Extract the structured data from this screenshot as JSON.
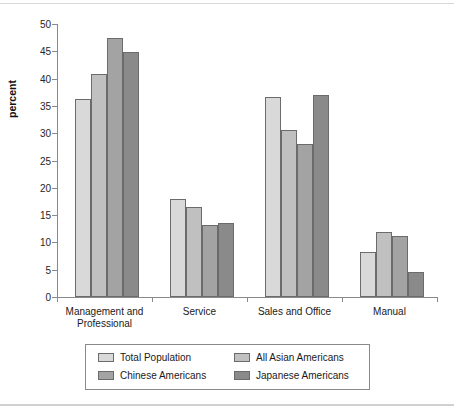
{
  "axis": {
    "ylabel": "percent",
    "yticks": [
      "0",
      "5",
      "10",
      "15",
      "20",
      "25",
      "30",
      "35",
      "40",
      "45",
      "50"
    ]
  },
  "legend": {
    "items": [
      {
        "label": "Total Population",
        "color": "#d9d9d9"
      },
      {
        "label": "All Asian Americans",
        "color": "#c0c0c0"
      },
      {
        "label": "Chinese Americans",
        "color": "#a3a3a3"
      },
      {
        "label": "Japanese Americans",
        "color": "#8a8a8a"
      }
    ]
  },
  "chart_data": {
    "type": "bar",
    "title": "",
    "subtitle": "",
    "xlabel": "",
    "ylabel": "percent",
    "ylim": [
      0,
      50
    ],
    "ytick_step": 5,
    "grid": false,
    "legend_position": "bottom",
    "categories": [
      "Management and\nProfessional",
      "Service",
      "Sales and Office",
      "Manual"
    ],
    "series": [
      {
        "name": "Total Population",
        "color": "#d9d9d9",
        "values": [
          36.3,
          18.0,
          36.7,
          8.3
        ]
      },
      {
        "name": "All Asian Americans",
        "color": "#c0c0c0",
        "values": [
          40.9,
          16.4,
          30.5,
          11.9
        ]
      },
      {
        "name": "Chinese Americans",
        "color": "#a3a3a3",
        "values": [
          47.5,
          13.2,
          28.0,
          11.2
        ]
      },
      {
        "name": "Japanese Americans",
        "color": "#8a8a8a",
        "values": [
          44.8,
          13.6,
          37.0,
          4.5
        ]
      }
    ]
  }
}
